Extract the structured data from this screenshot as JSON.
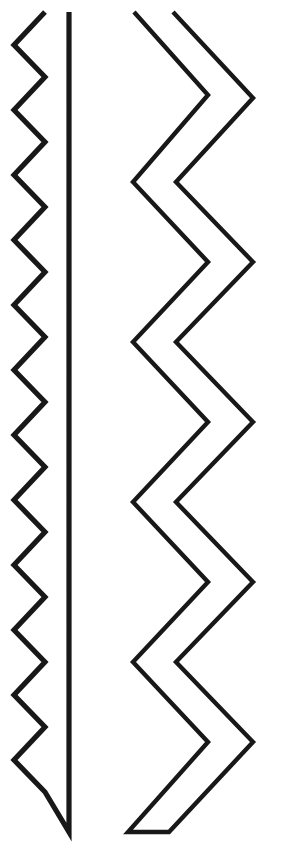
{
  "figure": {
    "canvas": {
      "width": 282,
      "height": 861,
      "background_color": "#ffffff"
    },
    "style": {
      "stroke_color": "#181818",
      "fill_color": "none",
      "stroke_width_left": 5.2,
      "stroke_width_right": 4.4,
      "line_join": "miter",
      "line_cap": "butt"
    },
    "shapes": [
      {
        "name": "fine-zigzag-shape",
        "label": "Fine-toothed zigzag closed by a vertical line",
        "tooth_count": 13,
        "tooth_period_px": 65,
        "amplitude_px": 31,
        "zigzag_left_x": 14,
        "zigzag_right_x": 45,
        "closing_line_x": 69,
        "top_y": 12,
        "bottom_y": 832,
        "path": "M 45 12 L 14 45 L 45 77 L 14 110 L 45 142 L 14 175 L 45 207 L 14 240 L 45 272 L 14 305 L 45 337 L 14 370 L 45 402 L 14 435 L 45 467 L 14 500 L 45 532 L 14 565 L 45 597 L 14 630 L 45 662 L 14 695 L 45 727 L 14 760 L 45 792 L 45 792 L 69 832 L 69 12"
      },
      {
        "name": "coarse-zigzag-band",
        "label": "Wide zigzag band formed by two parallel chevron lines",
        "tooth_count": 5,
        "tooth_period_px": 160,
        "amplitude_px": 75,
        "inner_left_x": 133,
        "inner_right_x": 208,
        "outer_left_x": 173,
        "outer_right_x": 253,
        "top_y": 12,
        "bottom_y": 832,
        "band_width_px": 40,
        "path": "M 134 12 L 208 95 L 133 182 L 208 262 L 133 342 L 208 422 L 133 502 L 208 582 L 133 662 L 208 742 L 128 832 L 169 832 L 253 742 L 176 662 L 253 582 L 176 502 L 253 422 L 176 342 L 253 262 L 176 182 L 253 98 L 173 12"
      }
    ]
  }
}
